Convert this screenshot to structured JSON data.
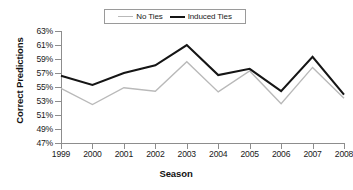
{
  "chart_data": {
    "type": "line",
    "title": "",
    "xlabel": "Season",
    "ylabel": "Correct Predictions",
    "categories": [
      "1999",
      "2000",
      "2001",
      "2002",
      "2003",
      "2004",
      "2005",
      "2006",
      "2007",
      "2008"
    ],
    "x": [
      1999,
      2000,
      2001,
      2002,
      2003,
      2004,
      2005,
      2006,
      2007,
      2008
    ],
    "ytick_labels": [
      "63%",
      "61%",
      "59%",
      "57%",
      "55%",
      "53%",
      "51%",
      "49%",
      "47%"
    ],
    "ytick_values": [
      63,
      61,
      59,
      57,
      55,
      53,
      51,
      49,
      47
    ],
    "ylim": [
      47,
      63
    ],
    "y_unit": "%",
    "grid": false,
    "legend_position": "top-center",
    "series": [
      {
        "name": "No Ties",
        "color": "#b9b9b9",
        "width": 1.4,
        "values": [
          54.8,
          52.5,
          54.9,
          54.4,
          58.6,
          54.3,
          57.3,
          52.6,
          57.8,
          53.4
        ]
      },
      {
        "name": "Induced Ties",
        "color": "#151515",
        "width": 2.1,
        "values": [
          56.6,
          55.3,
          57.0,
          58.1,
          61.0,
          56.7,
          57.6,
          54.4,
          59.3,
          53.9
        ]
      }
    ]
  },
  "legend": {
    "entries": [
      {
        "label": "No Ties"
      },
      {
        "label": "Induced Ties"
      }
    ]
  }
}
